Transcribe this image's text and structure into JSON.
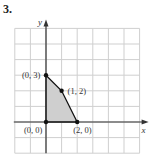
{
  "problem_number": "3.",
  "axes": {
    "x_label": "x",
    "y_label": "y"
  },
  "grid": {
    "cols": 8,
    "rows": 8,
    "x_min": -2,
    "x_max": 6,
    "y_min": -2,
    "y_max": 6
  },
  "region": {
    "fill": "#cfcfcf",
    "vertices": [
      {
        "x": 0,
        "y": 0,
        "label": "(0, 0)"
      },
      {
        "x": 0,
        "y": 3,
        "label": "(0, 3)"
      },
      {
        "x": 1,
        "y": 2,
        "label": "(1, 2)"
      },
      {
        "x": 2,
        "y": 0,
        "label": "(2, 0)"
      }
    ]
  },
  "colors": {
    "grid": "#cfcfcf",
    "axis": "#333333",
    "point": "#111111"
  }
}
